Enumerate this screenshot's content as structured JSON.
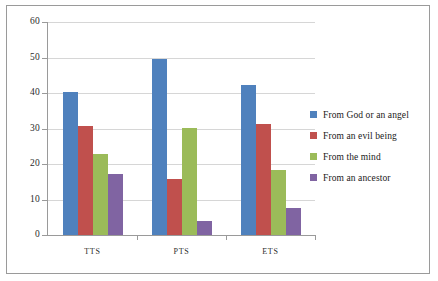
{
  "chart_data": {
    "type": "bar",
    "title": "",
    "subtitle": "",
    "xlabel": "",
    "ylabel": "",
    "categories": [
      "TTS",
      "PTS",
      "ETS"
    ],
    "series": [
      {
        "name": "From God or an angel",
        "color": "#4F81BD",
        "values": [
          40.3,
          49.7,
          42.2
        ]
      },
      {
        "name": "From an evil being",
        "color": "#C0504D",
        "values": [
          30.7,
          15.9,
          31.3
        ]
      },
      {
        "name": "From the mind",
        "color": "#9BBB59",
        "values": [
          22.8,
          30.1,
          18.3
        ]
      },
      {
        "name": "From an ancestor",
        "color": "#8064A2",
        "values": [
          17.2,
          3.9,
          7.5
        ]
      }
    ],
    "ylim": [
      0,
      60
    ],
    "yticks": [
      0,
      10,
      20,
      30,
      40,
      50,
      60
    ],
    "ytick_labels": [
      "0",
      "10",
      "20",
      "30",
      "40",
      "50",
      "60"
    ],
    "grid": "horizontal",
    "legend_position": "right",
    "plot_background": "#ffffff",
    "gridline_color": "#D6D6D6",
    "axis_color": "#9A9A9A",
    "border_color": "#9A9A9A"
  }
}
